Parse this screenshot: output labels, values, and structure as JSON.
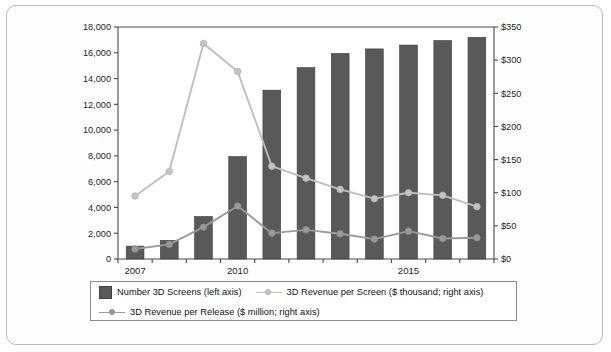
{
  "chart_data": {
    "type": "bar",
    "title": "",
    "subtitle": "",
    "xlabel": "",
    "ylabel": "",
    "grid": false,
    "legend_position": "bottom",
    "categories": [
      "2007",
      "2008",
      "2009",
      "2010",
      "2011",
      "2012",
      "2013",
      "2014",
      "2015",
      "2016",
      "2017"
    ],
    "x_tick_labels": [
      "2007",
      "2010",
      "2015"
    ],
    "x_tick_categories": [
      "2007",
      "2010",
      "2015"
    ],
    "left_axis": {
      "label": "",
      "ylim": [
        0,
        18000
      ],
      "ticks": [
        0,
        2000,
        4000,
        6000,
        8000,
        10000,
        12000,
        14000,
        16000,
        18000
      ],
      "tick_labels": [
        "0",
        "2,000",
        "4,000",
        "6,000",
        "8,000",
        "10,000",
        "12,000",
        "14,000",
        "16,000",
        "18,000"
      ]
    },
    "right_axis": {
      "label": "",
      "ylim": [
        0,
        350
      ],
      "ticks": [
        0,
        50,
        100,
        150,
        200,
        250,
        300,
        350
      ],
      "tick_labels": [
        "$0",
        "$50",
        "$100",
        "$150",
        "$200",
        "$250",
        "$300",
        "$350"
      ]
    },
    "series": [
      {
        "name": "Number 3D Screens (left axis)",
        "type": "bar",
        "axis": "left",
        "color": "#595959",
        "values": [
          1000,
          1450,
          3300,
          7950,
          13100,
          14850,
          15950,
          16300,
          16600,
          16950,
          17200
        ]
      },
      {
        "name": "3D Revenue per Screen ($ thousand; right axis)",
        "type": "line",
        "axis": "right",
        "color": "#bfbfbf",
        "values": [
          95,
          132,
          325,
          283,
          140,
          122,
          105,
          91,
          100,
          96,
          79
        ]
      },
      {
        "name": "3D Revenue per Release ($ million; right axis)",
        "type": "line",
        "axis": "right",
        "color": "#9a9a9a",
        "values": [
          15,
          22,
          48,
          80,
          39,
          44,
          38,
          30,
          42,
          31,
          32
        ]
      }
    ]
  },
  "legend": {
    "entries": [
      {
        "label": "Number 3D Screens (left axis)",
        "marker": "bar-swatch"
      },
      {
        "label": "3D Revenue per Screen ($ thousand; right axis)",
        "marker": "line-marker-light"
      },
      {
        "label": "3D Revenue per Release ($ million; right axis)",
        "marker": "line-marker-dark"
      }
    ]
  }
}
